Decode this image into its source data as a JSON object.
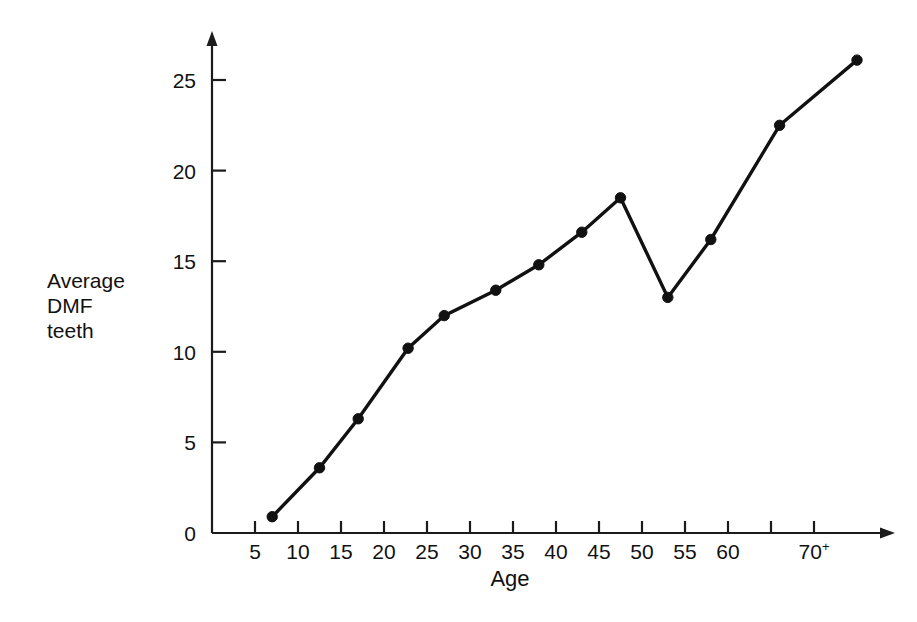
{
  "chart_data": {
    "type": "line",
    "title": "",
    "subtitle": "",
    "xlabel": "Age",
    "ylabel": "Average DMF teeth",
    "ylabel_lines": [
      "Average",
      "DMF",
      "teeth"
    ],
    "xlim": [
      0,
      78
    ],
    "ylim": [
      0,
      27
    ],
    "grid": false,
    "legend": "none",
    "x_ticks": [
      {
        "value": 5,
        "label": "5"
      },
      {
        "value": 10,
        "label": "10"
      },
      {
        "value": 15,
        "label": "15"
      },
      {
        "value": 20,
        "label": "20"
      },
      {
        "value": 25,
        "label": "25"
      },
      {
        "value": 30,
        "label": "30"
      },
      {
        "value": 35,
        "label": "35"
      },
      {
        "value": 40,
        "label": "40"
      },
      {
        "value": 45,
        "label": "45"
      },
      {
        "value": 50,
        "label": "50"
      },
      {
        "value": 55,
        "label": "55"
      },
      {
        "value": 60,
        "label": "60"
      },
      {
        "value": 65,
        "label": ""
      },
      {
        "value": 70,
        "label": "70",
        "superscript": "+"
      }
    ],
    "y_ticks": [
      {
        "value": 0,
        "label": "0"
      },
      {
        "value": 5,
        "label": "5"
      },
      {
        "value": 10,
        "label": "10"
      },
      {
        "value": 15,
        "label": "15"
      },
      {
        "value": 20,
        "label": "20"
      },
      {
        "value": 25,
        "label": "25"
      }
    ],
    "series": [
      {
        "name": "Average DMF teeth",
        "color": "#111111",
        "marker": "filled-circle",
        "x": [
          7,
          12.5,
          17,
          22.8,
          27,
          33,
          38,
          43,
          47.5,
          53,
          58,
          66,
          75
        ],
        "values": [
          0.9,
          3.6,
          6.3,
          10.2,
          12.0,
          13.4,
          14.8,
          16.6,
          18.5,
          13.0,
          16.2,
          22.5,
          26.1
        ]
      }
    ],
    "x_tick_labels_text": [
      "5",
      "10",
      "15",
      "20",
      "25",
      "30",
      "35",
      "40",
      "45",
      "50",
      "55",
      "60",
      "70+"
    ],
    "y_tick_labels_text": [
      "0",
      "5",
      "10",
      "15",
      "20",
      "25"
    ]
  },
  "axes": {
    "x_title": "Age",
    "y_title_line1": "Average",
    "y_title_line2": "DMF",
    "y_title_line3": "teeth"
  },
  "colors": {
    "ink": "#111111",
    "axis": "#1b1b1b",
    "background": "#ffffff"
  }
}
